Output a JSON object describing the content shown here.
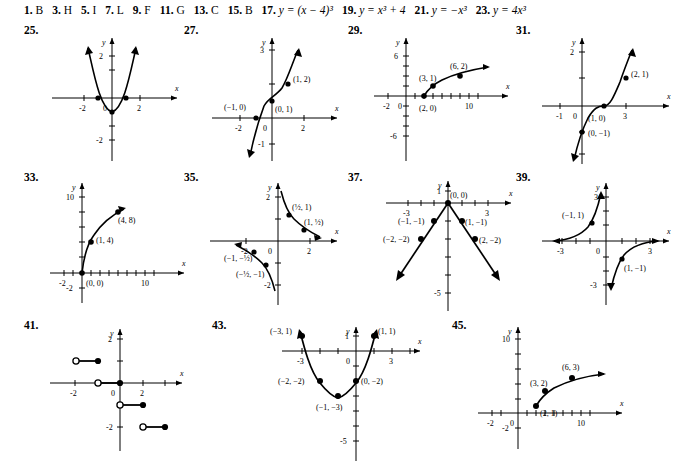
{
  "page": {
    "answer_line": [
      {
        "number": "1.",
        "answer": "B"
      },
      {
        "number": "3.",
        "answer": "H"
      },
      {
        "number": "5.",
        "answer": "I"
      },
      {
        "number": "7.",
        "answer": "L"
      },
      {
        "number": "9.",
        "answer": "F"
      },
      {
        "number": "11.",
        "answer": "G"
      },
      {
        "number": "13.",
        "answer": "C"
      },
      {
        "number": "15.",
        "answer": "B"
      },
      {
        "number": "17.",
        "answer": "y = (x − 4)³"
      },
      {
        "number": "19.",
        "answer": "y = x³ + 4"
      },
      {
        "number": "21.",
        "answer": "y = −x³"
      },
      {
        "number": "23.",
        "answer": "y = 4x³"
      }
    ]
  },
  "graphs": [
    {
      "number": "25.",
      "type": "parabola",
      "xlabel": "x",
      "ylabel": "y",
      "xticks": [
        "-2",
        "2"
      ],
      "yticks": [
        "2",
        "-2"
      ],
      "origin_label": "0",
      "points": [],
      "curve_note": "upward parabola, vertex (0,-1), roots at -1 and 1, arrows both ends"
    },
    {
      "number": "27.",
      "type": "cubic",
      "xlabel": "x",
      "ylabel": "y",
      "xticks": [
        "-2",
        "2"
      ],
      "yticks": [
        "3",
        "-1"
      ],
      "origin_label": "0",
      "points": [
        {
          "label": "(−1, 0)",
          "x": -1,
          "y": 0
        },
        {
          "label": "(0, 1)",
          "x": 0,
          "y": 1
        },
        {
          "label": "(1, 2)",
          "x": 1,
          "y": 2
        }
      ],
      "curve_note": "cubic y = x³ + 1 shape"
    },
    {
      "number": "29.",
      "type": "sqrt",
      "xlabel": "x",
      "ylabel": "y",
      "xticks": [
        "-2",
        "10"
      ],
      "yticks": [
        "6",
        "-6"
      ],
      "origin_label": "0",
      "points": [
        {
          "label": "(2, 0)",
          "x": 2,
          "y": 0
        },
        {
          "label": "(3, 1)",
          "x": 3,
          "y": 1
        },
        {
          "label": "(6, 2)",
          "x": 6,
          "y": 2
        }
      ],
      "curve_note": "square root curve starting at (2,0)"
    },
    {
      "number": "31.",
      "type": "cubic",
      "xlabel": "x",
      "ylabel": "y",
      "xticks": [
        "-1",
        "3"
      ],
      "yticks": [
        "2"
      ],
      "origin_label": "0",
      "points": [
        {
          "label": "(0, −1)",
          "x": 0,
          "y": -1
        },
        {
          "label": "(1, 0)",
          "x": 1,
          "y": 0
        },
        {
          "label": "(2, 1)",
          "x": 2,
          "y": 1
        }
      ],
      "curve_note": "cubic y = (x−1)³ shape"
    },
    {
      "number": "33.",
      "type": "sqrt",
      "xlabel": "x",
      "ylabel": "y",
      "xticks": [
        "-2",
        "10"
      ],
      "yticks": [
        "10",
        "-2"
      ],
      "origin_label": "",
      "points": [
        {
          "label": "(0, 0)",
          "x": 0,
          "y": 0
        },
        {
          "label": "(1, 4)",
          "x": 1,
          "y": 4
        },
        {
          "label": "(4, 8)",
          "x": 4,
          "y": 8
        }
      ],
      "curve_note": "y = 4√x curve from origin"
    },
    {
      "number": "35.",
      "type": "hyperbola",
      "xlabel": "x",
      "ylabel": "y",
      "xticks": [
        "-2",
        "2"
      ],
      "yticks": [
        "2",
        "-2"
      ],
      "origin_label": "0",
      "points": [
        {
          "label": "(½, 1)",
          "x": 0.5,
          "y": 1
        },
        {
          "label": "(1, ½)",
          "x": 1,
          "y": 0.5
        },
        {
          "label": "(−1, −½)",
          "x": -1,
          "y": -0.5
        },
        {
          "label": "(−½, −1)",
          "x": -0.5,
          "y": -1
        }
      ],
      "curve_note": "y = 1/(2x) two branches"
    },
    {
      "number": "37.",
      "type": "abs",
      "xlabel": "x",
      "ylabel": "y",
      "xticks": [
        "-3",
        "3"
      ],
      "yticks": [
        "1",
        "-5"
      ],
      "origin_label": "",
      "points": [
        {
          "label": "(0, 0)",
          "x": 0,
          "y": 0
        },
        {
          "label": "(−1, −1)",
          "x": -1,
          "y": -1
        },
        {
          "label": "(1, −1)",
          "x": 1,
          "y": -1
        },
        {
          "label": "(−2, −2)",
          "x": -2,
          "y": -2
        },
        {
          "label": "(2, −2)",
          "x": 2,
          "y": -2
        }
      ],
      "curve_note": "inverted V, y = -|x|"
    },
    {
      "number": "39.",
      "type": "hyperbola",
      "xlabel": "x",
      "ylabel": "y",
      "xticks": [
        "-3",
        "3"
      ],
      "yticks": [
        "3",
        "-3"
      ],
      "origin_label": "0",
      "points": [
        {
          "label": "(−1, 1)",
          "x": -1,
          "y": 1
        },
        {
          "label": "(1, −1)",
          "x": 1,
          "y": -1
        }
      ],
      "curve_note": "y = -1/x two branches"
    },
    {
      "number": "41.",
      "type": "step",
      "xlabel": "x",
      "ylabel": "y",
      "xticks": [
        "-2",
        "2"
      ],
      "yticks": [
        "2",
        "-2"
      ],
      "origin_label": "0",
      "points": [],
      "segments": [
        {
          "x0": -2,
          "x1": -1,
          "y": 1,
          "open_left": true,
          "closed_right": true
        },
        {
          "x0": -1,
          "x1": 0,
          "y": 0,
          "open_left": true,
          "closed_right": true
        },
        {
          "x0": 0,
          "x1": 1,
          "y": -1,
          "open_left": true,
          "closed_right": true
        },
        {
          "x0": 1,
          "x1": 2,
          "y": -2,
          "open_left": true,
          "closed_right": true
        }
      ],
      "curve_note": "greatest integer step function"
    },
    {
      "number": "43.",
      "type": "parabola",
      "xlabel": "x",
      "ylabel": "y",
      "xticks": [
        "-3",
        "3"
      ],
      "yticks": [
        "1",
        "-5"
      ],
      "origin_label": "0",
      "points": [
        {
          "label": "(−3, 1)",
          "x": -3,
          "y": 1
        },
        {
          "label": "(−2, −2)",
          "x": -2,
          "y": -2
        },
        {
          "label": "(−1, −3)",
          "x": -1,
          "y": -3
        },
        {
          "label": "(0, −2)",
          "x": 0,
          "y": -2
        },
        {
          "label": "(1, 1)",
          "x": 1,
          "y": 1
        }
      ],
      "curve_note": "upward parabola, vertex (-1,-3)"
    },
    {
      "number": "45.",
      "type": "sqrt",
      "xlabel": "x",
      "ylabel": "y",
      "xticks": [
        "-2",
        "10"
      ],
      "yticks": [
        "10",
        "-2"
      ],
      "origin_label": "0",
      "points": [
        {
          "label": "(2, 1)",
          "x": 2,
          "y": 1
        },
        {
          "label": "(3, 2)",
          "x": 3,
          "y": 2
        },
        {
          "label": "(6, 3)",
          "x": 6,
          "y": 3
        }
      ],
      "curve_note": "square root curve shifted, starts near (2,1)"
    }
  ]
}
